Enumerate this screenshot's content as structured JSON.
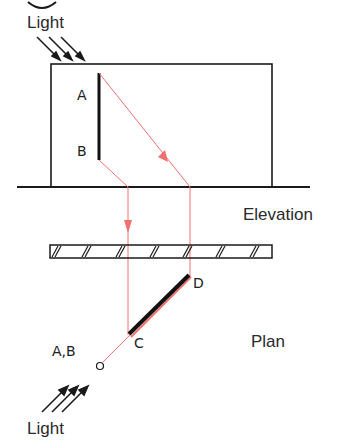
{
  "labels": {
    "light_top": "Light",
    "light_bottom": "Light",
    "elevation": "Elevation",
    "plan": "Plan",
    "point_a": "A",
    "point_b": "B",
    "point_c": "C",
    "point_d": "D",
    "point_ab": "A,B"
  },
  "colors": {
    "line": "#1a1a1a",
    "projection": "#f07070"
  }
}
